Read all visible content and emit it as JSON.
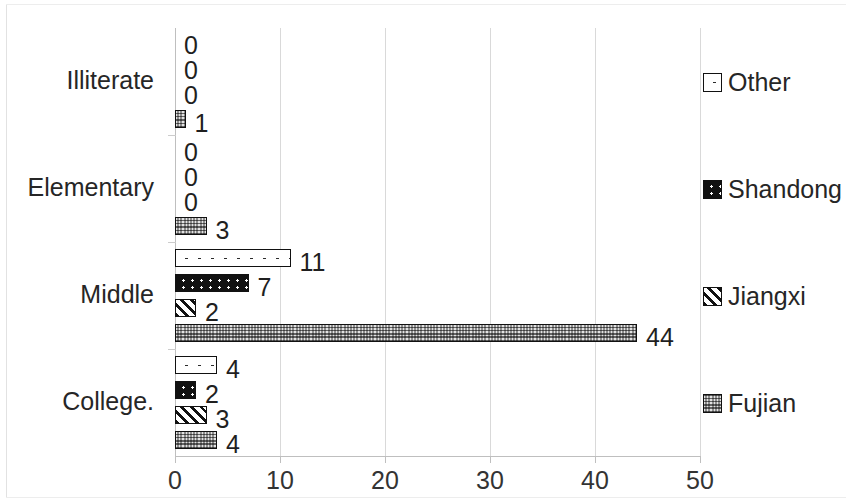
{
  "chart_data": {
    "type": "bar",
    "orientation": "horizontal",
    "grouped": true,
    "title": "",
    "xlabel": "",
    "ylabel": "",
    "xlim": [
      0,
      50
    ],
    "xticks": [
      0,
      10,
      20,
      30,
      40,
      50
    ],
    "xtick_labels": [
      "0",
      "10",
      "20",
      "30",
      "40",
      "50"
    ],
    "grid": "vertical",
    "legend_position": "right",
    "categories": [
      "Illiterate",
      "Elementary",
      "Middle",
      "College"
    ],
    "series": [
      {
        "name": "Other",
        "pattern": "white-dotted",
        "values": [
          0,
          0,
          11,
          4
        ]
      },
      {
        "name": "Shandong",
        "pattern": "black-white-dots",
        "values": [
          0,
          0,
          7,
          2
        ]
      },
      {
        "name": "Jiangxi",
        "pattern": "diagonal-stripes",
        "values": [
          0,
          0,
          2,
          3
        ]
      },
      {
        "name": "Fujian",
        "pattern": "gray-checker",
        "values": [
          1,
          3,
          44,
          4
        ]
      }
    ],
    "data_labels": [
      [
        "0",
        "0",
        "11",
        "4"
      ],
      [
        "0",
        "0",
        "7",
        "2"
      ],
      [
        "0",
        "0",
        "2",
        "3"
      ],
      [
        "1",
        "3",
        "44",
        "4"
      ]
    ]
  },
  "axis": {
    "x_ticks": [
      {
        "label": "0",
        "value": 0
      },
      {
        "label": "10",
        "value": 10
      },
      {
        "label": "20",
        "value": 20
      },
      {
        "label": "30",
        "value": 30
      },
      {
        "label": "40",
        "value": 40
      },
      {
        "label": "50",
        "value": 50
      }
    ],
    "categories": [
      {
        "label": "Illiterate"
      },
      {
        "label": "Elementary"
      },
      {
        "label": "Middle"
      },
      {
        "label": "College."
      }
    ]
  },
  "legend": {
    "items": [
      {
        "label": "Other",
        "pattern": "white-dotted"
      },
      {
        "label": "Shandong",
        "pattern": "black-white-dots"
      },
      {
        "label": "Jiangxi",
        "pattern": "diagonal-stripes"
      },
      {
        "label": "Fujian",
        "pattern": "gray-checker"
      }
    ]
  },
  "colors": {
    "bar_outline": "#111111",
    "gridline": "#d9d9d9",
    "axis": "#bfbfbf",
    "text": "#262626",
    "fujian_fill": "#8e8e8e",
    "shandong_fill": "#111111",
    "other_fill": "#ffffff"
  }
}
